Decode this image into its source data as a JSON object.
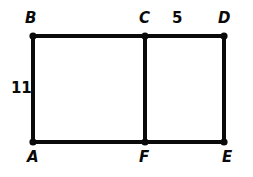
{
  "figure": {
    "background_color": "#ffffff",
    "stroke_color": "#0a0a0a",
    "label_color": "#0a0a0a",
    "stroke_width": 4,
    "vertex_dot_radius": 3.6,
    "vertices": [
      {
        "id": "B",
        "label": "B",
        "x": 33,
        "y": 36
      },
      {
        "id": "C",
        "label": "C",
        "x": 145,
        "y": 36
      },
      {
        "id": "D",
        "label": "D",
        "x": 224,
        "y": 36
      },
      {
        "id": "A",
        "label": "A",
        "x": 33,
        "y": 142
      },
      {
        "id": "F",
        "label": "F",
        "x": 145,
        "y": 142
      },
      {
        "id": "E",
        "label": "E",
        "x": 224,
        "y": 142
      }
    ],
    "edges": [
      {
        "id": "BC",
        "from": "B",
        "to": "C"
      },
      {
        "id": "CD",
        "from": "C",
        "to": "D"
      },
      {
        "id": "AF",
        "from": "A",
        "to": "F"
      },
      {
        "id": "FE",
        "from": "F",
        "to": "E"
      },
      {
        "id": "AB",
        "from": "A",
        "to": "B"
      },
      {
        "id": "FC",
        "from": "F",
        "to": "C"
      },
      {
        "id": "ED",
        "from": "E",
        "to": "D"
      }
    ],
    "measurements": [
      {
        "id": "side-AB",
        "value": "11",
        "edge": "AB",
        "position": "left"
      },
      {
        "id": "side-CD",
        "value": "5",
        "edge": "CD",
        "position": "above"
      }
    ]
  }
}
